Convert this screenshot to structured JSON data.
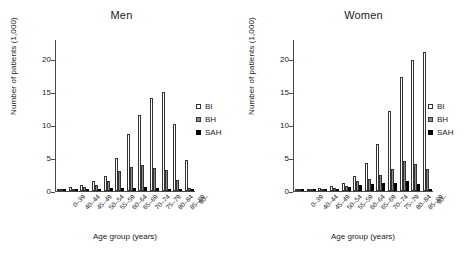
{
  "chart_data": [
    {
      "type": "bar",
      "title": "Men",
      "xlabel": "Age group (years)",
      "ylabel": "Number of patients (1,000)",
      "ylim": [
        0,
        23
      ],
      "yticks": [
        0,
        5,
        10,
        15,
        20
      ],
      "grid": false,
      "legend_position": "right",
      "categories": [
        "0–39",
        "40–44",
        "45–49",
        "50–54",
        "55–59",
        "60–64",
        "65–69",
        "70–74",
        "75–79",
        "80–84",
        "85–89",
        "90–"
      ],
      "series": [
        {
          "name": "BI",
          "values": [
            0.25,
            0.55,
            0.95,
            1.45,
            2.35,
            5.1,
            8.7,
            11.6,
            14.2,
            15.1,
            10.2,
            4.8
          ]
        },
        {
          "name": "BH",
          "values": [
            0.15,
            0.35,
            0.55,
            0.95,
            1.5,
            3.0,
            3.6,
            3.9,
            3.5,
            3.2,
            1.7,
            0.45
          ]
        },
        {
          "name": "SAH",
          "values": [
            0.1,
            0.2,
            0.3,
            0.35,
            0.4,
            0.5,
            0.5,
            0.55,
            0.4,
            0.35,
            0.25,
            0.1
          ]
        }
      ]
    },
    {
      "type": "bar",
      "title": "Women",
      "xlabel": "Age group (years)",
      "ylabel": "Number of patients (1,000)",
      "ylim": [
        0,
        23
      ],
      "yticks": [
        0,
        5,
        10,
        15,
        20
      ],
      "grid": false,
      "legend_position": "right",
      "categories": [
        "0–39",
        "40–44",
        "45–49",
        "50–54",
        "55–59",
        "60–64",
        "65–69",
        "70–74",
        "75–79",
        "80–84",
        "85–89",
        "90–"
      ],
      "series": [
        {
          "name": "BI",
          "values": [
            0.15,
            0.3,
            0.45,
            0.7,
            1.15,
            2.3,
            4.3,
            7.1,
            12.2,
            17.3,
            19.9,
            21.2
          ]
        },
        {
          "name": "BH",
          "values": [
            0.1,
            0.2,
            0.3,
            0.5,
            0.8,
            1.5,
            1.9,
            2.4,
            3.4,
            4.5,
            4.1,
            3.4
          ]
        },
        {
          "name": "SAH",
          "values": [
            0.1,
            0.15,
            0.25,
            0.35,
            0.55,
            0.85,
            1.1,
            1.15,
            1.25,
            1.5,
            1.1,
            0.35
          ]
        }
      ]
    }
  ],
  "panels": {
    "men": {
      "title": "Men",
      "ylabel": "Number of patients (1,000)",
      "xlabel": "Age group (years)",
      "yticks": [
        "0",
        "5",
        "10",
        "15",
        "20"
      ],
      "xticks": [
        "0–39",
        "40–44",
        "45–49",
        "50–54",
        "55–59",
        "60–64",
        "65–69",
        "70–74",
        "75–79",
        "80–84",
        "85–89",
        "90–"
      ],
      "legend": [
        {
          "label": "BI",
          "swatch": "white-square-icon"
        },
        {
          "label": "BH",
          "swatch": "gray-square-icon"
        },
        {
          "label": "SAH",
          "swatch": "black-square-icon"
        }
      ]
    },
    "women": {
      "title": "Women",
      "ylabel": "Number of patients (1,000)",
      "xlabel": "Age group (years)",
      "yticks": [
        "0",
        "5",
        "10",
        "15",
        "20"
      ],
      "xticks": [
        "0–39",
        "40–44",
        "45–49",
        "50–54",
        "55–59",
        "60–64",
        "65–69",
        "70–74",
        "75–79",
        "80–84",
        "85–89",
        "90–"
      ],
      "legend": [
        {
          "label": "BI",
          "swatch": "white-square-icon"
        },
        {
          "label": "BH",
          "swatch": "gray-square-icon"
        },
        {
          "label": "SAH",
          "swatch": "black-square-icon"
        }
      ]
    }
  },
  "colors": {
    "bi": "#ffffff",
    "bh": "#8c8c8c",
    "sah": "#000000",
    "axis": "#4a4a4a",
    "text": "#1a1a1a"
  }
}
